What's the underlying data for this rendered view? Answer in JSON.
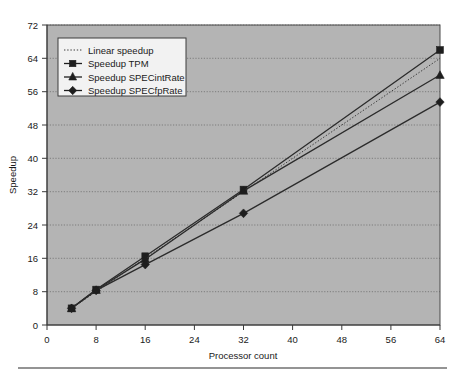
{
  "chart_data": {
    "type": "line",
    "title": "",
    "xlabel": "Processor count",
    "ylabel": "Speedup",
    "xlim": [
      0,
      64
    ],
    "ylim": [
      0,
      72
    ],
    "xticks": [
      0,
      8,
      16,
      24,
      32,
      40,
      48,
      56,
      64
    ],
    "yticks": [
      0,
      8,
      16,
      24,
      32,
      40,
      48,
      56,
      64,
      72
    ],
    "grid": "horizontal-dotted",
    "legend_position": "upper-left-inside",
    "x": [
      4,
      8,
      16,
      32,
      64
    ],
    "series": [
      {
        "name": "Linear speedup",
        "marker": "none",
        "style": "dotted",
        "values": [
          4,
          8,
          16,
          32,
          64
        ]
      },
      {
        "name": "Speedup TPM",
        "marker": "square",
        "style": "solid",
        "values": [
          4,
          8.5,
          16.5,
          32.5,
          66
        ]
      },
      {
        "name": "Speedup SPECintRate",
        "marker": "triangle",
        "style": "solid",
        "values": [
          4,
          8.4,
          15.8,
          32.2,
          60
        ]
      },
      {
        "name": "Speedup SPECfpRate",
        "marker": "diamond",
        "style": "solid",
        "values": [
          4,
          8.3,
          14.5,
          26.8,
          53.5
        ]
      }
    ],
    "colors": {
      "plot_background": "#b4b4b4",
      "page_background": "#ffffff",
      "line": "#2b2b2b",
      "grid": "#6e6e6e",
      "axis": "#3a3a3a",
      "text": "#1a1a1a",
      "legend_background": "#f2f2f2"
    }
  },
  "axis": {
    "x_title": "Processor count",
    "y_title": "Speedup",
    "x_tick_labels": [
      "0",
      "8",
      "16",
      "24",
      "32",
      "40",
      "48",
      "56",
      "64"
    ],
    "y_tick_labels": [
      "0",
      "8",
      "16",
      "24",
      "32",
      "40",
      "48",
      "56",
      "64",
      "72"
    ]
  },
  "legend": {
    "items": [
      {
        "label": "Linear speedup",
        "marker": "dotted-line-swatch"
      },
      {
        "label": "Speedup TPM",
        "marker": "square-marker-swatch"
      },
      {
        "label": "Speedup SPECintRate",
        "marker": "triangle-marker-swatch"
      },
      {
        "label": "Speedup SPECfpRate",
        "marker": "diamond-marker-swatch"
      }
    ]
  }
}
